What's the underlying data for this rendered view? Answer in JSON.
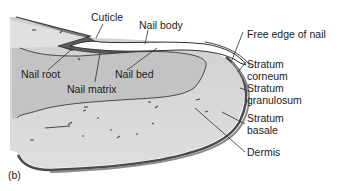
{
  "figure": {
    "panel_label": "(b)",
    "labels": {
      "cuticle": "Cuticle",
      "nail_body": "Nail body",
      "nail_root": "Nail root",
      "nail_bed": "Nail bed",
      "nail_matrix": "Nail matrix",
      "free_edge": "Free edge of nail",
      "stratum_corneum_1": "Stratum",
      "stratum_corneum_2": "corneum",
      "stratum_granulosum_1": "Stratum",
      "stratum_granulosum_2": "granulosum",
      "stratum_basale_1": "Stratum",
      "stratum_basale_2": "basale",
      "dermis": "Dermis"
    },
    "colors": {
      "dermis_fill": "#d6d6d6",
      "nail_bed_fill": "#c4c4c4",
      "nail_plate": "#ffffff",
      "dark_layer": "#555555",
      "outline": "#2e2e2e",
      "background": "#ffffff"
    }
  }
}
